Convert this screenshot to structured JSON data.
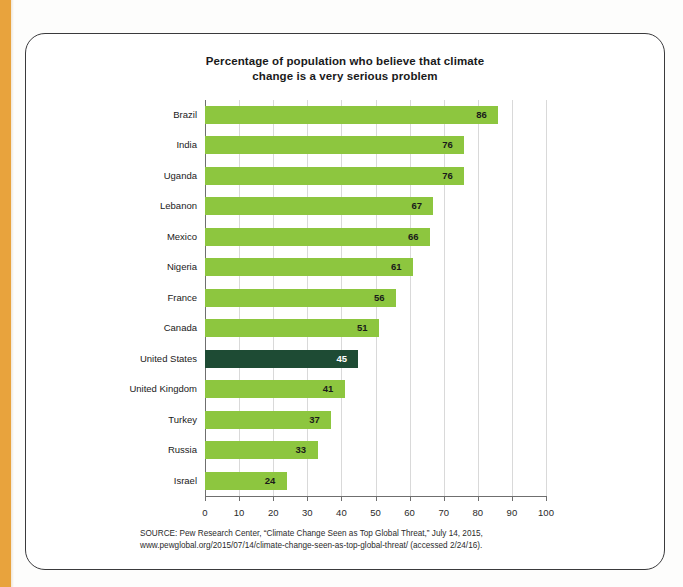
{
  "page": {
    "accent_color": "#e8a33d",
    "cutoff_top_text": ""
  },
  "figure": {
    "frame_color": "#3a3a3c",
    "source_line_1": "SOURCE: Pew Research Center, “Climate Change Seen as Top Global Threat,” July 14, 2015,",
    "source_line_2": "www.pewglobal.org/2015/07/14/climate-change-seen-as-top-global-threat/ (accessed 2/24/16)."
  },
  "chart_data": {
    "type": "bar",
    "orientation": "horizontal",
    "title": "Percentage of population who believe that climate change is a very serious problem",
    "title_line_1": "Percentage of population who believe that climate",
    "title_line_2": "change is a very serious problem",
    "xlabel": "",
    "ylabel": "",
    "xlim": [
      0,
      100
    ],
    "xticks": [
      0,
      10,
      20,
      30,
      40,
      50,
      60,
      70,
      80,
      90,
      100
    ],
    "grid": true,
    "legend": false,
    "bar_color": "#8dc63f",
    "highlight_color": "#1e4b34",
    "categories": [
      "Brazil",
      "India",
      "Uganda",
      "Lebanon",
      "Mexico",
      "Nigeria",
      "France",
      "Canada",
      "United States",
      "United Kingdom",
      "Turkey",
      "Russia",
      "Israel"
    ],
    "values": [
      86,
      76,
      76,
      67,
      66,
      61,
      56,
      51,
      45,
      41,
      37,
      33,
      24
    ],
    "highlighted": [
      "United States"
    ],
    "bars": [
      {
        "category": "Brazil",
        "value": 86,
        "highlight": false
      },
      {
        "category": "India",
        "value": 76,
        "highlight": false
      },
      {
        "category": "Uganda",
        "value": 76,
        "highlight": false
      },
      {
        "category": "Lebanon",
        "value": 67,
        "highlight": false
      },
      {
        "category": "Mexico",
        "value": 66,
        "highlight": false
      },
      {
        "category": "Nigeria",
        "value": 61,
        "highlight": false
      },
      {
        "category": "France",
        "value": 56,
        "highlight": false
      },
      {
        "category": "Canada",
        "value": 51,
        "highlight": false
      },
      {
        "category": "United States",
        "value": 45,
        "highlight": true
      },
      {
        "category": "United Kingdom",
        "value": 41,
        "highlight": false
      },
      {
        "category": "Turkey",
        "value": 37,
        "highlight": false
      },
      {
        "category": "Russia",
        "value": 33,
        "highlight": false
      },
      {
        "category": "Israel",
        "value": 24,
        "highlight": false
      }
    ]
  }
}
